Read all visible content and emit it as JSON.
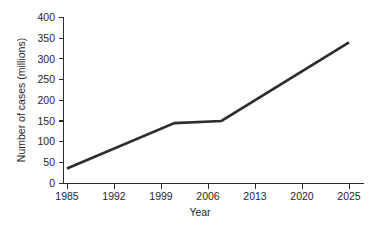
{
  "chart_data": {
    "type": "line",
    "title": "",
    "xlabel": "Year",
    "ylabel": "Number of cases (millions)",
    "xticklabels": [
      "1985",
      "1992",
      "1999",
      "2006",
      "2013",
      "2020",
      "2025"
    ],
    "yticklabels": [
      "0",
      "50",
      "100",
      "150",
      "200",
      "250",
      "300",
      "350",
      "400"
    ],
    "ylim": [
      0,
      400
    ],
    "ytick_step": 50,
    "grid": false,
    "legend": false,
    "series": [
      {
        "name": "Number of cases",
        "color": "#2e2e2e",
        "x": [
          1985,
          2001,
          2008,
          2025
        ],
        "values": [
          35,
          145,
          150,
          340
        ]
      }
    ],
    "annotations": []
  },
  "axes": {
    "x_title": "Year",
    "y_title": "Number of cases (millions)",
    "x_ticks": [
      {
        "label": "1985",
        "px": 67
      },
      {
        "label": "1992",
        "px": 114
      },
      {
        "label": "1999",
        "px": 161
      },
      {
        "label": "2006",
        "px": 208
      },
      {
        "label": "2013",
        "px": 255
      },
      {
        "label": "2020",
        "px": 302
      },
      {
        "label": "2025",
        "px": 349
      }
    ],
    "y_ticks": [
      {
        "label": "400",
        "value": 400
      },
      {
        "label": "350",
        "value": 350
      },
      {
        "label": "300",
        "value": 300
      },
      {
        "label": "250",
        "value": 250
      },
      {
        "label": "200",
        "value": 200
      },
      {
        "label": "150",
        "value": 150
      },
      {
        "label": "100",
        "value": 100
      },
      {
        "label": "50",
        "value": 50
      },
      {
        "label": "0",
        "value": 0
      }
    ]
  },
  "colors": {
    "line": "#2e2e2e",
    "axis": "#2b2b2b",
    "text": "#1f1f1f",
    "background": "#ffffff"
  }
}
